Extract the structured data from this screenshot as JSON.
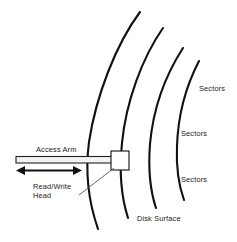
{
  "diagram": {
    "background_color": "#ffffff",
    "line_color": "#111111",
    "labels": {
      "access_arm": "Access Arm",
      "read_write_head_line1": "Read/Write",
      "read_write_head_line2": "Head",
      "sectors_1": "Sectors",
      "sectors_2": "Sectors",
      "sectors_3": "Sectors",
      "disk_surface": "Disk Surface"
    },
    "components": {
      "arc_count": 4,
      "arm_label": "Access Arm",
      "head_label": "Read/Write Head",
      "motion_arrow": "double-headed-horizontal"
    }
  }
}
